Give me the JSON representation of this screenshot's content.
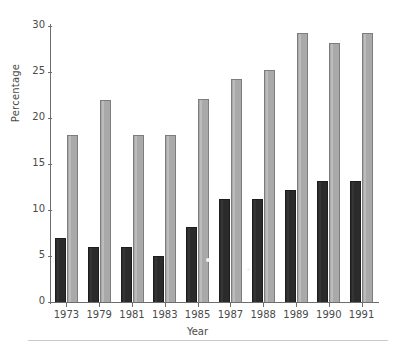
{
  "chart_data": {
    "type": "bar",
    "title": "",
    "subtitle": "",
    "xlabel": "Year",
    "ylabel": "Percentage",
    "categories": [
      "1973",
      "1979",
      "1981",
      "1983",
      "1985",
      "1987",
      "1988",
      "1989",
      "1990",
      "1991"
    ],
    "ylim": [
      0,
      30
    ],
    "yticks": [
      0,
      5,
      10,
      15,
      20,
      25,
      30
    ],
    "ytick_labels": [
      "0",
      "5",
      "10",
      "15",
      "20",
      "25",
      "30"
    ],
    "grid": false,
    "legend": "none",
    "series": [
      {
        "name": "dark-series",
        "color": "#2b2b2b",
        "values": [
          7.0,
          6.0,
          6.0,
          5.0,
          8.1,
          11.2,
          11.2,
          12.2,
          13.2,
          13.2
        ]
      },
      {
        "name": "light-series",
        "color": "#a9a9a9",
        "values": [
          18.1,
          22.0,
          18.1,
          18.1,
          22.1,
          24.2,
          25.2,
          29.2,
          28.2,
          29.2
        ]
      }
    ]
  },
  "axis_colors": {
    "spine": "#6d6d6d",
    "text": "#4a4a4a",
    "background": "#ffffff"
  }
}
